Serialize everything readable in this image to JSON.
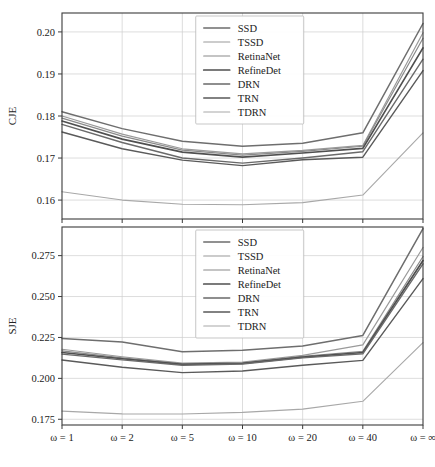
{
  "figure": {
    "background": "#ffffff",
    "width": 435,
    "height": 467
  },
  "legend": {
    "entries": [
      "SSD",
      "TSSD",
      "RetinaNet",
      "RefineDet",
      "DRN",
      "TRN",
      "TDRN"
    ],
    "position": "upper center"
  },
  "series_colors": {
    "SSD": "#6e6e6e",
    "TSSD": "#9a9a9a",
    "RetinaNet": "#8a8a8a",
    "RefineDet": "#4f4f4f",
    "DRN": "#6a6a6a",
    "TRN": "#5a5a5a",
    "TDRN": "#a8a8a8"
  },
  "chart_data": [
    {
      "type": "line",
      "title": "",
      "xlabel": "",
      "ylabel": "CJE",
      "categories": [
        "ω = 1",
        "ω = 2",
        "ω = 5",
        "ω = 10",
        "ω = 20",
        "ω = 40",
        "ω = ∞"
      ],
      "yticks": [
        0.16,
        0.17,
        0.18,
        0.19,
        0.2
      ],
      "ytick_labels": [
        "0.16",
        "0.17",
        "0.18",
        "0.19",
        "0.20"
      ],
      "ylim": [
        0.1555,
        0.2045
      ],
      "grid": true,
      "series": [
        {
          "name": "SSD",
          "values": [
            0.181,
            0.177,
            0.174,
            0.1728,
            0.1735,
            0.176,
            0.202
          ]
        },
        {
          "name": "TSSD",
          "values": [
            0.18,
            0.1757,
            0.1722,
            0.171,
            0.1718,
            0.173,
            0.1998
          ]
        },
        {
          "name": "RetinaNet",
          "values": [
            0.1795,
            0.1752,
            0.1719,
            0.1707,
            0.1716,
            0.1728,
            0.1985
          ]
        },
        {
          "name": "RefineDet",
          "values": [
            0.1788,
            0.1745,
            0.1714,
            0.1702,
            0.1712,
            0.1723,
            0.1962
          ]
        },
        {
          "name": "DRN",
          "values": [
            0.178,
            0.1737,
            0.17,
            0.1688,
            0.17,
            0.1715,
            0.1935
          ]
        },
        {
          "name": "TRN",
          "values": [
            0.1762,
            0.1722,
            0.1695,
            0.1682,
            0.1696,
            0.1702,
            0.1908
          ]
        },
        {
          "name": "TDRN",
          "values": [
            0.162,
            0.16,
            0.159,
            0.1589,
            0.1594,
            0.1612,
            0.176
          ]
        }
      ]
    },
    {
      "type": "line",
      "title": "",
      "xlabel": "",
      "ylabel": "SJE",
      "categories": [
        "ω = 1",
        "ω = 2",
        "ω = 5",
        "ω = 10",
        "ω = 20",
        "ω = 40",
        "ω = ∞"
      ],
      "yticks": [
        0.175,
        0.2,
        0.225,
        0.25,
        0.275
      ],
      "ytick_labels": [
        "0.175",
        "0.200",
        "0.225",
        "0.250",
        "0.275"
      ],
      "ylim": [
        0.1715,
        0.2925
      ],
      "grid": true,
      "series": [
        {
          "name": "SSD",
          "values": [
            0.2243,
            0.2222,
            0.2163,
            0.2172,
            0.2198,
            0.2262,
            0.2915
          ]
        },
        {
          "name": "TSSD",
          "values": [
            0.2178,
            0.2132,
            0.2093,
            0.21,
            0.214,
            0.2205,
            0.28
          ]
        },
        {
          "name": "RetinaNet",
          "values": [
            0.2168,
            0.2125,
            0.2088,
            0.2095,
            0.2135,
            0.2165,
            0.2745
          ]
        },
        {
          "name": "RefineDet",
          "values": [
            0.2158,
            0.212,
            0.2085,
            0.2092,
            0.213,
            0.2158,
            0.272
          ]
        },
        {
          "name": "DRN",
          "values": [
            0.2148,
            0.2113,
            0.208,
            0.2088,
            0.2125,
            0.215,
            0.27
          ]
        },
        {
          "name": "TRN",
          "values": [
            0.2112,
            0.2068,
            0.2035,
            0.2045,
            0.208,
            0.211,
            0.261
          ]
        },
        {
          "name": "TDRN",
          "values": [
            0.18,
            0.1783,
            0.1782,
            0.1792,
            0.1812,
            0.186,
            0.2218
          ]
        }
      ]
    }
  ]
}
